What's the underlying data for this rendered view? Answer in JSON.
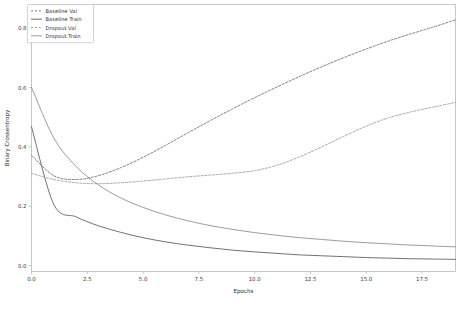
{
  "chart_data": {
    "type": "line",
    "title": "",
    "xlabel": "Epochs",
    "ylabel": "Binary Crossentropy",
    "xlim": [
      0,
      19
    ],
    "ylim": [
      -0.02,
      0.88
    ],
    "grid": false,
    "legend_position": "upper left",
    "xticks": [
      "0.0",
      "2.5",
      "5.0",
      "7.5",
      "10.0",
      "12.5",
      "15.0",
      "17.5"
    ],
    "xtick_values": [
      0.0,
      2.5,
      5.0,
      7.5,
      10.0,
      12.5,
      15.0,
      17.5
    ],
    "yticks": [
      "0.0",
      "0.2",
      "0.4",
      "0.6",
      "0.8"
    ],
    "ytick_values": [
      0.0,
      0.2,
      0.4,
      0.6,
      0.8
    ],
    "x": [
      0,
      1,
      2,
      3,
      4,
      5,
      6,
      7,
      8,
      9,
      10,
      11,
      12,
      13,
      14,
      15,
      16,
      17,
      18,
      19
    ],
    "series": [
      {
        "name": "Baseline Val",
        "style": "dashed",
        "color": "#6e6e6e",
        "values": [
          0.372,
          0.303,
          0.29,
          0.303,
          0.33,
          0.365,
          0.405,
          0.447,
          0.488,
          0.528,
          0.566,
          0.602,
          0.637,
          0.67,
          0.701,
          0.73,
          0.757,
          0.781,
          0.804,
          0.828
        ]
      },
      {
        "name": "Baseline Train",
        "style": "solid",
        "color": "#595959",
        "values": [
          0.468,
          0.206,
          0.164,
          0.134,
          0.112,
          0.094,
          0.08,
          0.069,
          0.06,
          0.052,
          0.046,
          0.041,
          0.036,
          0.033,
          0.03,
          0.027,
          0.025,
          0.023,
          0.022,
          0.021
        ]
      },
      {
        "name": "Dropout Val",
        "style": "dashed",
        "color": "#9a9a9a",
        "values": [
          0.311,
          0.29,
          0.279,
          0.276,
          0.279,
          0.285,
          0.292,
          0.299,
          0.305,
          0.311,
          0.32,
          0.338,
          0.366,
          0.4,
          0.436,
          0.47,
          0.498,
          0.518,
          0.534,
          0.55
        ]
      },
      {
        "name": "Dropout Train",
        "style": "solid",
        "color": "#8a8a8a",
        "values": [
          0.601,
          0.43,
          0.334,
          0.272,
          0.228,
          0.196,
          0.171,
          0.151,
          0.135,
          0.122,
          0.111,
          0.102,
          0.094,
          0.088,
          0.082,
          0.077,
          0.073,
          0.069,
          0.066,
          0.063
        ]
      }
    ]
  },
  "legend": {
    "entries": [
      {
        "label": "Baseline Val"
      },
      {
        "label": "Baseline Train"
      },
      {
        "label": "Dropout Val"
      },
      {
        "label": "Dropout Train"
      }
    ]
  }
}
